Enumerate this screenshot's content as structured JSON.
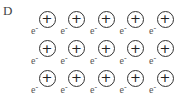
{
  "option_label": "D",
  "ion_symbol": "+",
  "electron_symbol": "e",
  "electron_charge": "-",
  "layout": {
    "rows": 3,
    "cols": 5,
    "first_center_x": 47,
    "first_center_y": 19,
    "col_spacing": 29.5,
    "row_spacing": 29.5
  },
  "diagram": {
    "rows": [
      {
        "ions": [
          "+",
          "+",
          "+",
          "+",
          "+"
        ],
        "electrons": [
          "e-",
          "e-",
          "e-",
          "e-",
          "e-"
        ]
      },
      {
        "ions": [
          "+",
          "+",
          "+",
          "+",
          "+"
        ],
        "electrons": [
          "e-",
          "e-",
          "e-",
          "e-",
          "e-"
        ]
      },
      {
        "ions": [
          "+",
          "+",
          "+",
          "+",
          "+"
        ],
        "electrons": [
          "e-",
          "e-",
          "e-",
          "e-",
          "e-"
        ]
      }
    ]
  }
}
